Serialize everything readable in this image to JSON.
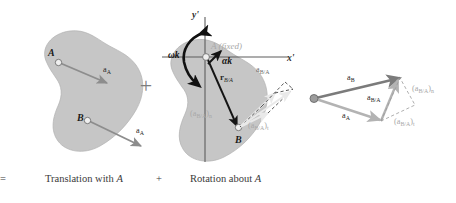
{
  "figure": {
    "equals_sign": "=",
    "plus_sign_1": "+",
    "plus_sign_2": "+",
    "captions": {
      "translation": "Translation with ",
      "translation_point": "A",
      "rotation": "Rotation about ",
      "rotation_point": "A"
    }
  },
  "panel_translation": {
    "point_a": "A",
    "point_b": "B",
    "vector_a_top": "a",
    "vector_a_top_sub": "A",
    "vector_a_bottom": "a",
    "vector_a_bottom_sub": "A"
  },
  "panel_rotation": {
    "axis_y": "y'",
    "axis_x": "x'",
    "omega_k": "ωk",
    "alpha_k": "αk",
    "a_fixed": "A (fixed)",
    "r_ba": "r",
    "r_ba_sub": "B/A",
    "point_b": "B",
    "a_ba": "a",
    "a_ba_sub": "B/A",
    "a_ba_n": "(a",
    "a_ba_n_sub": "B/A",
    "a_ba_n_close": ")",
    "a_ba_n_sub2": "n",
    "a_ba_t": "(a",
    "a_ba_t_sub": "B/A",
    "a_ba_t_close": ")",
    "a_ba_t_sub2": "t"
  },
  "panel_vectors": {
    "a_b": "a",
    "a_b_sub": "B",
    "a_a": "a",
    "a_a_sub": "A",
    "a_ba": "a",
    "a_ba_sub": "B/A",
    "a_ba_n": "(a",
    "a_ba_n_sub": "B/A",
    "a_ba_n_close": ")",
    "a_ba_n_sub2": "n",
    "a_ba_t": "(a",
    "a_ba_t_sub": "B/A",
    "a_ba_t_close": ")",
    "a_ba_t_sub2": "t"
  },
  "colors": {
    "blob_fill": "#c6c6c6",
    "vector_dark": "#7b7b7b",
    "vector_light": "#b3b3b3",
    "vector_black": "#141414",
    "caption_text": "#3a3a3a"
  }
}
